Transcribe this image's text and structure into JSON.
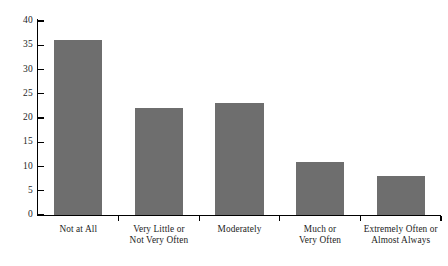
{
  "chart_data": {
    "type": "bar",
    "title": "",
    "subtitle": "",
    "xlabel": "",
    "ylabel": "",
    "categories": [
      "Not at All",
      "Very Little or\nNot Very Often",
      "Moderately",
      "Much or\nVery Often",
      "Extremely Often or\nAlmost Always"
    ],
    "values": [
      36,
      22,
      23,
      11,
      8
    ],
    "ylim": [
      0,
      40
    ],
    "y_ticks": [
      0,
      5,
      10,
      15,
      20,
      25,
      30,
      35,
      40
    ],
    "y_tick_labels": [
      "0",
      "5",
      "10",
      "15",
      "20",
      "25",
      "30",
      "35",
      "40"
    ],
    "grid": false,
    "legend": null,
    "bar_color": "#6e6e6e",
    "axis_color": "#000000",
    "background_color": "#ffffff"
  }
}
